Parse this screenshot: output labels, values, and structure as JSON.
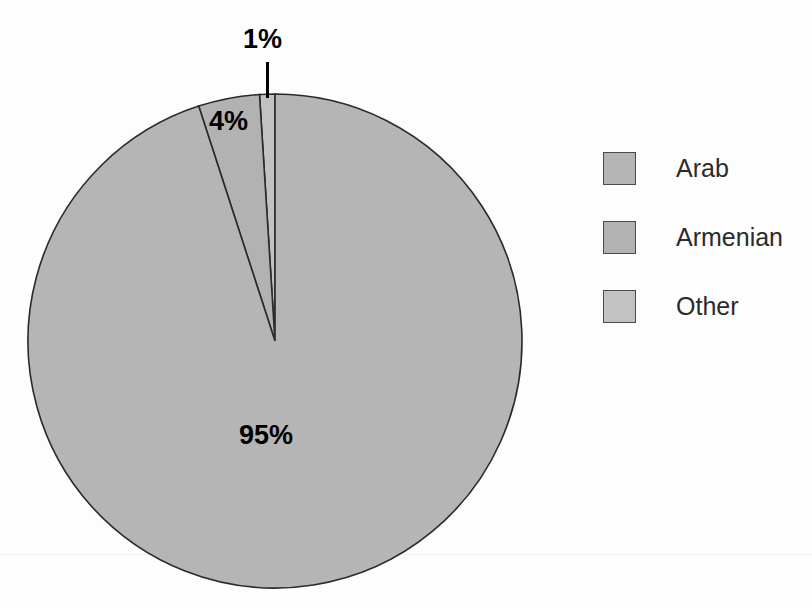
{
  "chart_data": {
    "type": "pie",
    "title": "",
    "categories": [
      "Arab",
      "Armenian",
      "Other"
    ],
    "values": [
      95,
      4,
      1
    ],
    "unit": "%",
    "data_labels": [
      "95%",
      "4%",
      "1%"
    ],
    "legend_position": "right",
    "grid": false,
    "colors": [
      "#b5b5b5",
      "#b2b2b2",
      "#c2c2c2"
    ],
    "slice_outline_color": "#2a2a2a",
    "start_angle_deg": 90,
    "direction": "counterclockwise",
    "background": "#fdfdfd"
  },
  "figure": {
    "pie": {
      "center_x": 275,
      "center_y": 341,
      "radius": 247,
      "slices": [
        {
          "name": "Other",
          "label": "1%",
          "value": 1,
          "color": "#c2c2c2"
        },
        {
          "name": "Armenian",
          "label": "4%",
          "value": 4,
          "color": "#b2b2b2"
        },
        {
          "name": "Arab",
          "label": "95%",
          "value": 95,
          "color": "#b5b5b5"
        }
      ]
    },
    "labels": {
      "other_pct": "1%",
      "armenian_pct": "4%",
      "arab_pct": "95%"
    }
  },
  "legend": {
    "items": [
      {
        "label": "Arab",
        "color": "#b5b5b5"
      },
      {
        "label": "Armenian",
        "color": "#b2b2b2"
      },
      {
        "label": "Other",
        "color": "#c2c2c2"
      }
    ]
  }
}
